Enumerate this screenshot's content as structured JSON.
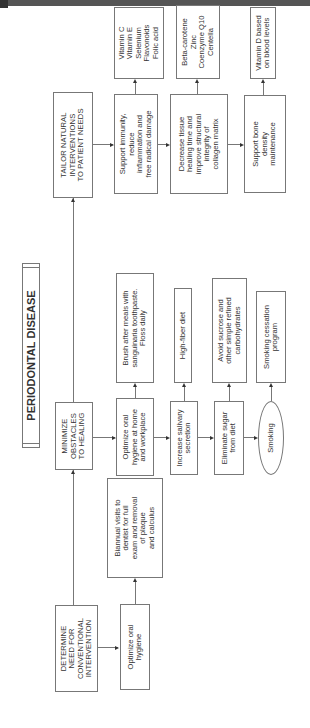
{
  "header": {
    "running_title": "The Clinician's Handbook"
  },
  "diagram": {
    "title": "PERIODONTAL DISEASE",
    "stages": [
      {
        "id": "determine",
        "label": "DETERMINE\nNEED FOR\nCONVENTIONAL\nINTERVENTION"
      },
      {
        "id": "minimize",
        "label": "MINIMIZE\nOBSTACLES\nTO HEALING"
      },
      {
        "id": "tailor",
        "label": "TAILOR NATURAL\nINTERVENTIONS\nTO PATIENT NEEDS"
      }
    ],
    "determine": {
      "step": "Optimize oral\nhygiene",
      "detail": "Biannual visits to\ndentist for full\nexam and removal\nof plaque\nand calculus"
    },
    "minimize": [
      {
        "step": "Optimize oral\nhygiene at home\nand workplace",
        "detail": "Brush after meals with\nsanguinaria toothpaste.\nFloss daily"
      },
      {
        "step": "Increase salivary\nsecretion",
        "detail": "High-fiber diet"
      },
      {
        "step": "Eliminate sugar\nfrom diet",
        "detail": "Avoid sucrose and\nother simple refined\ncarbohydrates"
      },
      {
        "step": "Smoking",
        "detail": "Smoking cessation\nprogram",
        "shape": "oval"
      }
    ],
    "tailor": [
      {
        "step": "Support immunity,\nreduce\ninflammation and\nfree radical damage",
        "detail": "Vitamin C\nVitamin E\nSelenium\nFlavonoids\nFolic acid"
      },
      {
        "step": "Decrease tissue\nhealing time and\nimprove structural\nintegrity of\ncollagen matrix",
        "detail": "Beta-carotene\nZinc\nCoenzyme Q10\nCentella"
      },
      {
        "step": "Support bone\ndensity\nmaintenance",
        "detail": "Vitamin D based\non blood levels"
      }
    ]
  },
  "colors": {
    "line": "#777777",
    "arrow": "#333333",
    "header": "#555555"
  }
}
